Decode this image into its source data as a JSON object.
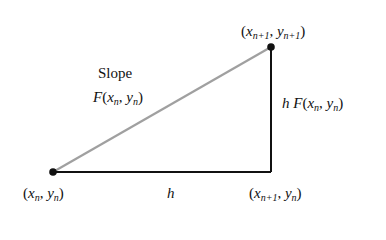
{
  "diagram": {
    "type": "euler-method-step",
    "points": {
      "start": {
        "label_x": "x",
        "label_x_sub": "n",
        "label_y": "y",
        "label_y_sub": "n"
      },
      "end": {
        "label_x": "x",
        "label_x_sub": "n+1",
        "label_y": "y",
        "label_y_sub": "n+1"
      },
      "corner": {
        "label_x": "x",
        "label_x_sub": "n+1",
        "label_y": "y",
        "label_y_sub": "n"
      }
    },
    "slope_label": {
      "title": "Slope",
      "func": "F",
      "x": "x",
      "x_sub": "n",
      "y": "y",
      "y_sub": "n"
    },
    "rise_label": {
      "h": "h",
      "func": "F",
      "x": "x",
      "x_sub": "n",
      "y": "y",
      "y_sub": "n"
    },
    "run_label": "h",
    "colors": {
      "line": "#111111",
      "hypotenuse": "#9a9a9a",
      "background": "#ffffff"
    }
  }
}
